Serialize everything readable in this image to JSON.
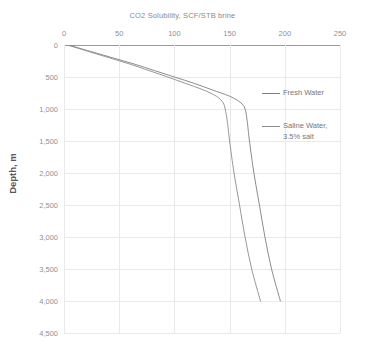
{
  "chart_data": {
    "type": "line",
    "title": "CO2 Solubility, SCF/STB brine",
    "xlabel": "",
    "ylabel": "Depth, m",
    "xlim": [
      0,
      250
    ],
    "ylim": [
      0,
      4500
    ],
    "y_inverted": true,
    "grid": true,
    "legend_position": "right",
    "xticks": [
      "0",
      "50",
      "100",
      "150",
      "200",
      "250"
    ],
    "xtick_values": [
      0,
      50,
      100,
      150,
      200,
      250
    ],
    "yticks": [
      "0",
      "500",
      "1,000",
      "1,500",
      "2,000",
      "2,500",
      "3,000",
      "3,500",
      "4,000",
      "4,500"
    ],
    "ytick_values": [
      0,
      500,
      1000,
      1500,
      2000,
      2500,
      3000,
      3500,
      4000,
      4500
    ],
    "series": [
      {
        "name": "Fresh Water",
        "color": "#7f7f83",
        "x_is_value": true,
        "points": [
          {
            "depth": 0,
            "solubility": 4
          },
          {
            "depth": 100,
            "solubility": 24
          },
          {
            "depth": 200,
            "solubility": 44
          },
          {
            "depth": 300,
            "solubility": 64
          },
          {
            "depth": 400,
            "solubility": 82
          },
          {
            "depth": 500,
            "solubility": 100
          },
          {
            "depth": 600,
            "solubility": 118
          },
          {
            "depth": 700,
            "solubility": 134
          },
          {
            "depth": 800,
            "solubility": 150
          },
          {
            "depth": 900,
            "solubility": 160
          },
          {
            "depth": 1000,
            "solubility": 164
          },
          {
            "depth": 1200,
            "solubility": 166
          },
          {
            "depth": 1500,
            "solubility": 168
          },
          {
            "depth": 2000,
            "solubility": 172
          },
          {
            "depth": 2500,
            "solubility": 177
          },
          {
            "depth": 3000,
            "solubility": 182
          },
          {
            "depth": 3500,
            "solubility": 188
          },
          {
            "depth": 4000,
            "solubility": 196
          }
        ]
      },
      {
        "name": "Saline Water,\n3.5% salt",
        "color": "#8c8c90",
        "x_is_value": true,
        "points": [
          {
            "depth": 0,
            "solubility": 3
          },
          {
            "depth": 100,
            "solubility": 22
          },
          {
            "depth": 200,
            "solubility": 41
          },
          {
            "depth": 300,
            "solubility": 60
          },
          {
            "depth": 400,
            "solubility": 77
          },
          {
            "depth": 500,
            "solubility": 94
          },
          {
            "depth": 600,
            "solubility": 110
          },
          {
            "depth": 700,
            "solubility": 126
          },
          {
            "depth": 800,
            "solubility": 138
          },
          {
            "depth": 900,
            "solubility": 144
          },
          {
            "depth": 1000,
            "solubility": 146
          },
          {
            "depth": 1200,
            "solubility": 148
          },
          {
            "depth": 1500,
            "solubility": 150
          },
          {
            "depth": 2000,
            "solubility": 154
          },
          {
            "depth": 2500,
            "solubility": 159
          },
          {
            "depth": 3000,
            "solubility": 164
          },
          {
            "depth": 3500,
            "solubility": 170
          },
          {
            "depth": 4000,
            "solubility": 178
          }
        ]
      }
    ],
    "legend": [
      {
        "label": "Fresh Water"
      },
      {
        "label": "Saline Water,\n3.5% salt"
      }
    ],
    "colors": {
      "grid": "#e9e9ec",
      "axis": "#9a9a9a",
      "tick_text": "#909094",
      "title_text": "#8a8a8a",
      "series_1": "#7f7f83",
      "series_2": "#8c8c90"
    }
  }
}
